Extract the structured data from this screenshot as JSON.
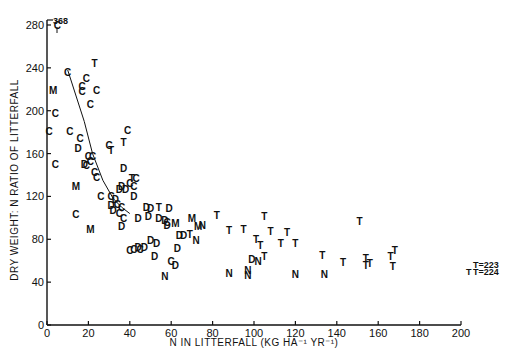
{
  "chart_data": {
    "type": "scatter",
    "title": "",
    "xlabel": "N IN LITTERFALL (KG HA⁻¹ YR⁻¹)",
    "ylabel": "DRY WEIGHT: N RATIO OF LITTERFALL",
    "xlim": [
      0,
      200
    ],
    "ylim": [
      0,
      280
    ],
    "xticks": [
      0,
      20,
      40,
      60,
      80,
      100,
      120,
      140,
      160,
      180,
      200
    ],
    "yticks": [
      0,
      40,
      80,
      120,
      160,
      200,
      240,
      280
    ],
    "grid": false,
    "legend": "none (points plotted as letter symbols C, D, M, N, T)",
    "marker_labels": [
      "C",
      "D",
      "M",
      "N",
      "T"
    ],
    "annotations": [
      {
        "text": "368",
        "x": 5,
        "y": 280,
        "note": "C point off-scale at 368, arrow up"
      },
      {
        "text": "T→223",
        "x": 200,
        "y": 58
      },
      {
        "text": "T→224",
        "x": 200,
        "y": 52
      }
    ],
    "fitted_line": [
      [
        10,
        238
      ],
      [
        18,
        190
      ],
      [
        22,
        160
      ],
      [
        27,
        135
      ],
      [
        32,
        118
      ],
      [
        36,
        110
      ],
      [
        40,
        104
      ]
    ],
    "points": [
      {
        "m": "C",
        "x": 5,
        "y": 280
      },
      {
        "m": "T",
        "x": 23,
        "y": 245
      },
      {
        "m": "C",
        "x": 10,
        "y": 236
      },
      {
        "m": "C",
        "x": 19,
        "y": 231
      },
      {
        "m": "C",
        "x": 17,
        "y": 223
      },
      {
        "m": "C",
        "x": 17,
        "y": 218
      },
      {
        "m": "C",
        "x": 24,
        "y": 219
      },
      {
        "m": "C",
        "x": 21,
        "y": 206
      },
      {
        "m": "M",
        "x": 3,
        "y": 219
      },
      {
        "m": "C",
        "x": 4,
        "y": 198
      },
      {
        "m": "C",
        "x": 1,
        "y": 181
      },
      {
        "m": "C",
        "x": 11,
        "y": 181
      },
      {
        "m": "C",
        "x": 16,
        "y": 175
      },
      {
        "m": "C",
        "x": 39,
        "y": 182
      },
      {
        "m": "T",
        "x": 37,
        "y": 171
      },
      {
        "m": "C",
        "x": 30,
        "y": 168
      },
      {
        "m": "T",
        "x": 31,
        "y": 163
      },
      {
        "m": "D",
        "x": 15,
        "y": 165
      },
      {
        "m": "C",
        "x": 20,
        "y": 158
      },
      {
        "m": "C",
        "x": 22,
        "y": 158
      },
      {
        "m": "C",
        "x": 21,
        "y": 153
      },
      {
        "m": "D",
        "x": 18,
        "y": 150
      },
      {
        "m": "C",
        "x": 19,
        "y": 149
      },
      {
        "m": "C",
        "x": 4,
        "y": 150
      },
      {
        "m": "C",
        "x": 23,
        "y": 143
      },
      {
        "m": "C",
        "x": 24,
        "y": 138
      },
      {
        "m": "D",
        "x": 37,
        "y": 147
      },
      {
        "m": "M",
        "x": 14,
        "y": 130
      },
      {
        "m": "C",
        "x": 40,
        "y": 133
      },
      {
        "m": "C",
        "x": 42,
        "y": 130
      },
      {
        "m": "D",
        "x": 36,
        "y": 130
      },
      {
        "m": "D",
        "x": 38,
        "y": 127
      },
      {
        "m": "D",
        "x": 35,
        "y": 127
      },
      {
        "m": "T",
        "x": 41,
        "y": 137
      },
      {
        "m": "C",
        "x": 43,
        "y": 137
      },
      {
        "m": "C",
        "x": 26,
        "y": 120
      },
      {
        "m": "C",
        "x": 31,
        "y": 120
      },
      {
        "m": "D",
        "x": 33,
        "y": 118
      },
      {
        "m": "D",
        "x": 31,
        "y": 112
      },
      {
        "m": "D",
        "x": 32,
        "y": 107
      },
      {
        "m": "C",
        "x": 34,
        "y": 113
      },
      {
        "m": "C",
        "x": 36,
        "y": 110
      },
      {
        "m": "C",
        "x": 35,
        "y": 105
      },
      {
        "m": "C",
        "x": 37,
        "y": 100
      },
      {
        "m": "D",
        "x": 42,
        "y": 120
      },
      {
        "m": "C",
        "x": 14,
        "y": 104
      },
      {
        "m": "M",
        "x": 21,
        "y": 90
      },
      {
        "m": "D",
        "x": 36,
        "y": 92
      },
      {
        "m": "D",
        "x": 44,
        "y": 100
      },
      {
        "m": "D",
        "x": 48,
        "y": 110
      },
      {
        "m": "D",
        "x": 50,
        "y": 109
      },
      {
        "m": "T",
        "x": 54,
        "y": 110
      },
      {
        "m": "D",
        "x": 59,
        "y": 109
      },
      {
        "m": "D",
        "x": 49,
        "y": 102
      },
      {
        "m": "D",
        "x": 54,
        "y": 100
      },
      {
        "m": "D",
        "x": 57,
        "y": 98
      },
      {
        "m": "C",
        "x": 58,
        "y": 96
      },
      {
        "m": "D",
        "x": 58,
        "y": 93
      },
      {
        "m": "M",
        "x": 62,
        "y": 95
      },
      {
        "m": "M",
        "x": 70,
        "y": 100
      },
      {
        "m": "M",
        "x": 73,
        "y": 92
      },
      {
        "m": "N",
        "x": 75,
        "y": 93
      },
      {
        "m": "T",
        "x": 82,
        "y": 103
      },
      {
        "m": "T",
        "x": 88,
        "y": 89
      },
      {
        "m": "T",
        "x": 95,
        "y": 90
      },
      {
        "m": "T",
        "x": 105,
        "y": 102
      },
      {
        "m": "T",
        "x": 108,
        "y": 88
      },
      {
        "m": "T",
        "x": 116,
        "y": 87
      },
      {
        "m": "T",
        "x": 120,
        "y": 77
      },
      {
        "m": "T",
        "x": 101,
        "y": 80
      },
      {
        "m": "T",
        "x": 103,
        "y": 75
      },
      {
        "m": "T",
        "x": 113,
        "y": 77
      },
      {
        "m": "D",
        "x": 64,
        "y": 84
      },
      {
        "m": "D",
        "x": 66,
        "y": 84
      },
      {
        "m": "T",
        "x": 69,
        "y": 85
      },
      {
        "m": "N",
        "x": 72,
        "y": 79
      },
      {
        "m": "D",
        "x": 50,
        "y": 79
      },
      {
        "m": "D",
        "x": 53,
        "y": 77
      },
      {
        "m": "D",
        "x": 47,
        "y": 73
      },
      {
        "m": "D",
        "x": 44,
        "y": 73
      },
      {
        "m": "C",
        "x": 40,
        "y": 70
      },
      {
        "m": "C",
        "x": 42,
        "y": 71
      },
      {
        "m": "C",
        "x": 45,
        "y": 71
      },
      {
        "m": "D",
        "x": 63,
        "y": 72
      },
      {
        "m": "D",
        "x": 52,
        "y": 64
      },
      {
        "m": "C",
        "x": 60,
        "y": 60
      },
      {
        "m": "D",
        "x": 62,
        "y": 56
      },
      {
        "m": "N",
        "x": 57,
        "y": 46
      },
      {
        "m": "D",
        "x": 99,
        "y": 62
      },
      {
        "m": "N",
        "x": 102,
        "y": 60
      },
      {
        "m": "T",
        "x": 105,
        "y": 64
      },
      {
        "m": "N",
        "x": 88,
        "y": 49
      },
      {
        "m": "N",
        "x": 97,
        "y": 51
      },
      {
        "m": "N",
        "x": 97,
        "y": 47
      },
      {
        "m": "N",
        "x": 120,
        "y": 48
      },
      {
        "m": "N",
        "x": 134,
        "y": 48
      },
      {
        "m": "T",
        "x": 133,
        "y": 65
      },
      {
        "m": "T",
        "x": 143,
        "y": 59
      },
      {
        "m": "T",
        "x": 151,
        "y": 97
      },
      {
        "m": "T",
        "x": 154,
        "y": 63
      },
      {
        "m": "T",
        "x": 154,
        "y": 56
      },
      {
        "m": "T",
        "x": 156,
        "y": 58
      },
      {
        "m": "T",
        "x": 166,
        "y": 64
      },
      {
        "m": "T",
        "x": 168,
        "y": 70
      },
      {
        "m": "T",
        "x": 167,
        "y": 55
      }
    ]
  },
  "axes": {
    "xlabel": "N IN LITTERFALL (KG HA⁻¹ YR⁻¹)",
    "ylabel": "DRY WEIGHT: N RATIO OF LITTERFALL",
    "xticks": [
      "0",
      "20",
      "40",
      "60",
      "80",
      "100",
      "120",
      "140",
      "160",
      "180",
      "200"
    ],
    "yticks": [
      "0",
      "40",
      "80",
      "120",
      "160",
      "200",
      "240",
      "280"
    ]
  },
  "annotations": {
    "top": "368",
    "right_1": "T=223",
    "right_2": "T=224",
    "right_extra": "T"
  }
}
